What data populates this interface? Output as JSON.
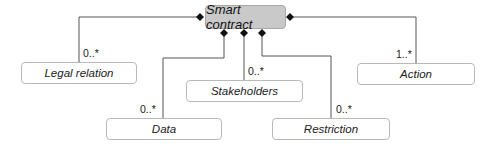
{
  "diagram": {
    "type": "UML class diagram (composition)",
    "root": {
      "label": "Smart contract",
      "fill": "#c9c9c9"
    },
    "classes": [
      {
        "id": "legal-relation",
        "label": "Legal relation",
        "multiplicity": "0..*"
      },
      {
        "id": "data",
        "label": "Data",
        "multiplicity": "0..*"
      },
      {
        "id": "stakeholders",
        "label": "Stakeholders",
        "multiplicity": "0..*"
      },
      {
        "id": "restriction",
        "label": "Restriction",
        "multiplicity": "0..*"
      },
      {
        "id": "action",
        "label": "Action",
        "multiplicity": "1..*"
      }
    ],
    "relation_marker": "filled-diamond (composition)"
  }
}
